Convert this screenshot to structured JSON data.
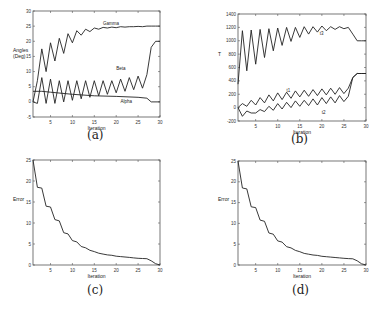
{
  "chart_data": [
    {
      "id": "a",
      "type": "line",
      "caption": "(a)",
      "xlabel": "Iteration",
      "ylabel": "Angles\n(Deg)",
      "xlim": [
        1,
        30
      ],
      "ylim": [
        -5,
        30
      ],
      "xticks": [
        5,
        10,
        15,
        20,
        25,
        30
      ],
      "yticks": [
        -5,
        0,
        5,
        10,
        15,
        20,
        25,
        30
      ],
      "grid": false,
      "box": {
        "x0": 33,
        "y0": 11,
        "x1": 160,
        "y1": 117
      },
      "series": [
        {
          "name": "Gamma",
          "label_at": [
            17,
            25.3
          ],
          "x": [
            1,
            2,
            3,
            4,
            5,
            6,
            7,
            8,
            9,
            10,
            11,
            12,
            13,
            14,
            15,
            16,
            17,
            18,
            19,
            20,
            21,
            22,
            23,
            24,
            25,
            26,
            27,
            28,
            29,
            30
          ],
          "values": [
            0,
            7,
            17.5,
            10,
            19.5,
            13.5,
            21,
            16,
            22.5,
            19.5,
            23.5,
            22,
            24,
            23.2,
            24.4,
            24,
            24.6,
            24.4,
            24.7,
            24.5,
            24.8,
            24.7,
            24.8,
            24.8,
            24.9,
            24.8,
            25,
            25,
            25,
            25
          ]
        },
        {
          "name": "Beta",
          "label_at": [
            20,
            10.5
          ],
          "x": [
            1,
            2,
            3,
            4,
            5,
            6,
            7,
            8,
            9,
            10,
            11,
            12,
            13,
            14,
            15,
            16,
            17,
            18,
            19,
            20,
            21,
            22,
            23,
            24,
            25,
            26,
            27,
            28,
            29,
            30
          ],
          "values": [
            0,
            -0.5,
            8,
            -0.5,
            7.5,
            -0.5,
            7,
            0,
            7,
            0.5,
            7,
            1,
            7,
            1.5,
            7,
            2,
            7,
            2.5,
            7,
            3,
            7.5,
            3.5,
            8,
            4,
            8.5,
            4.5,
            9,
            18,
            20,
            20
          ]
        },
        {
          "name": "Alpha",
          "label_at": [
            21,
            -0.5
          ],
          "x": [
            1,
            3,
            5,
            10,
            15,
            20,
            25,
            27,
            28,
            30
          ],
          "values": [
            3.5,
            3.5,
            3.2,
            2.5,
            2,
            1.8,
            1.5,
            1.2,
            0,
            0
          ]
        }
      ]
    },
    {
      "id": "b",
      "type": "line",
      "caption": "(b)",
      "xlabel": "Iteration",
      "ylabel": "T",
      "xlim": [
        1,
        30
      ],
      "ylim": [
        -200,
        1400
      ],
      "xticks": [
        5,
        10,
        15,
        20,
        25,
        30
      ],
      "yticks": [
        -200,
        0,
        200,
        400,
        600,
        800,
        1000,
        1200,
        1400
      ],
      "grid": false,
      "box": {
        "x0": 238,
        "y0": 14,
        "x1": 366,
        "y1": 121
      },
      "series": [
        {
          "name": "t3",
          "label_at": [
            19.5,
            1080
          ],
          "x": [
            1,
            2,
            3,
            4,
            5,
            6,
            7,
            8,
            9,
            10,
            11,
            12,
            13,
            14,
            15,
            16,
            17,
            18,
            19,
            20,
            21,
            22,
            23,
            24,
            25,
            26,
            27,
            28,
            29,
            30
          ],
          "values": [
            350,
            1150,
            550,
            1160,
            650,
            1170,
            750,
            1180,
            850,
            1190,
            930,
            1200,
            990,
            1200,
            1050,
            1210,
            1100,
            1210,
            1130,
            1220,
            1150,
            1210,
            1170,
            1210,
            1180,
            1200,
            1100,
            1000,
            1000,
            1000
          ]
        },
        {
          "name": "t1",
          "label_at": [
            12,
            230
          ],
          "x": [
            1,
            2,
            3,
            4,
            5,
            6,
            7,
            8,
            9,
            10,
            11,
            12,
            13,
            14,
            15,
            16,
            17,
            18,
            19,
            20,
            21,
            22,
            23,
            24,
            25,
            26,
            27,
            28,
            29,
            30
          ],
          "values": [
            0,
            60,
            20,
            110,
            40,
            150,
            70,
            190,
            100,
            220,
            120,
            230,
            140,
            250,
            160,
            260,
            170,
            270,
            180,
            280,
            190,
            290,
            200,
            300,
            210,
            290,
            450,
            510,
            510,
            510
          ]
        },
        {
          "name": "t2",
          "label_at": [
            20,
            -100
          ],
          "x": [
            1,
            2,
            3,
            4,
            5,
            6,
            7,
            8,
            9,
            10,
            11,
            12,
            13,
            14,
            15,
            16,
            17,
            18,
            19,
            20,
            21,
            22,
            23,
            24,
            25,
            26,
            27,
            28,
            29,
            30
          ],
          "values": [
            0,
            -130,
            -50,
            -80,
            -80,
            -30,
            -60,
            20,
            -40,
            60,
            -20,
            80,
            0,
            100,
            20,
            110,
            30,
            130,
            40,
            150,
            60,
            160,
            70,
            180,
            90,
            170,
            450,
            510,
            510,
            510
          ]
        }
      ]
    },
    {
      "id": "c",
      "type": "line",
      "caption": "(c)",
      "xlabel": "Iteration",
      "ylabel": "Error",
      "xlim": [
        1,
        30
      ],
      "ylim": [
        0,
        25
      ],
      "xticks": [
        5,
        10,
        15,
        20,
        25,
        30
      ],
      "yticks": [
        0,
        5,
        10,
        15,
        20,
        25
      ],
      "grid": false,
      "box": {
        "x0": 33,
        "y0": 160,
        "x1": 160,
        "y1": 265
      },
      "series": [
        {
          "name": "Error",
          "x": [
            1,
            2,
            3,
            4,
            5,
            6,
            7,
            8,
            9,
            10,
            11,
            12,
            13,
            14,
            15,
            16,
            17,
            18,
            19,
            20,
            21,
            22,
            23,
            24,
            25,
            26,
            27,
            28,
            29,
            30
          ],
          "values": [
            25,
            18.5,
            18.3,
            14,
            13.8,
            10.8,
            10.5,
            7.7,
            7.4,
            5.8,
            5.5,
            4.4,
            4.1,
            3.5,
            3.2,
            2.8,
            2.6,
            2.4,
            2.3,
            2.1,
            2.0,
            1.9,
            1.8,
            1.7,
            1.6,
            1.55,
            1.5,
            1.0,
            0.3,
            0
          ]
        }
      ]
    },
    {
      "id": "d",
      "type": "line",
      "caption": "(d)",
      "xlabel": "Iteration",
      "ylabel": "Error",
      "xlim": [
        1,
        30
      ],
      "ylim": [
        0,
        25
      ],
      "xticks": [
        5,
        10,
        15,
        20,
        25,
        30
      ],
      "yticks": [
        0,
        5,
        10,
        15,
        20,
        25
      ],
      "grid": false,
      "box": {
        "x0": 238,
        "y0": 161,
        "x1": 366,
        "y1": 265
      },
      "series": [
        {
          "name": "Error",
          "x": [
            1,
            2,
            3,
            4,
            5,
            6,
            7,
            8,
            9,
            10,
            11,
            12,
            13,
            14,
            15,
            16,
            17,
            18,
            19,
            20,
            21,
            22,
            23,
            24,
            25,
            26,
            27,
            28,
            29,
            30
          ],
          "values": [
            25,
            18.5,
            18.3,
            14,
            13.8,
            10.8,
            10.5,
            7.7,
            7.4,
            5.8,
            5.5,
            4.4,
            4.1,
            3.5,
            3.2,
            2.8,
            2.6,
            2.4,
            2.3,
            2.1,
            2.0,
            1.9,
            1.8,
            1.7,
            1.6,
            1.55,
            1.5,
            1.0,
            0.3,
            0
          ]
        }
      ]
    }
  ],
  "captions": {
    "a": "(a)",
    "b": "(b)",
    "c": "(c)",
    "d": "(d)"
  }
}
